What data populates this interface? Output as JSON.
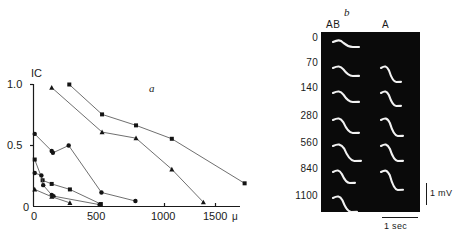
{
  "figure": {
    "panel_a_letter": "a",
    "panel_b_letter": "b"
  },
  "panel_a": {
    "ylabel": "IC",
    "y_ticks": [
      "1.0",
      "0.5",
      "0"
    ],
    "x_ticks": [
      "0",
      "500",
      "1000",
      "1500"
    ],
    "x_unit": "μ"
  },
  "panel_b": {
    "column_labels": [
      "AB",
      "A"
    ],
    "row_labels": [
      "0",
      "70",
      "140",
      "280",
      "560",
      "840",
      "1100"
    ],
    "scale_v": "1 mV",
    "scale_h": "1 sec"
  },
  "chart_data": {
    "type": "line",
    "title": "",
    "xlabel": "μ",
    "ylabel": "IC",
    "xlim": [
      0,
      1750
    ],
    "ylim": [
      0,
      1.0
    ],
    "grid": false,
    "legend": "none",
    "x_ticks": [
      0,
      500,
      1000,
      1500
    ],
    "y_ticks": [
      0,
      0.5,
      1.0
    ],
    "series": [
      {
        "name": "series-1-squares-upper",
        "marker": "square",
        "points": [
          {
            "x": 295,
            "y": 1.0
          },
          {
            "x": 565,
            "y": 0.755
          },
          {
            "x": 845,
            "y": 0.665
          },
          {
            "x": 1140,
            "y": 0.555
          },
          {
            "x": 1740,
            "y": 0.19
          }
        ]
      },
      {
        "name": "series-2-triangles-upper",
        "marker": "triangle",
        "points": [
          {
            "x": 150,
            "y": 0.975
          },
          {
            "x": 565,
            "y": 0.61
          },
          {
            "x": 845,
            "y": 0.56
          },
          {
            "x": 1140,
            "y": 0.305
          },
          {
            "x": 1400,
            "y": 0.035
          }
        ]
      },
      {
        "name": "series-3-circles-mid",
        "marker": "circle",
        "points": [
          {
            "x": 10,
            "y": 0.595
          },
          {
            "x": 150,
            "y": 0.455
          },
          {
            "x": 160,
            "y": 0.44
          },
          {
            "x": 290,
            "y": 0.5
          },
          {
            "x": 560,
            "y": 0.115
          },
          {
            "x": 840,
            "y": 0.045
          }
        ]
      },
      {
        "name": "series-4-squares-lower",
        "marker": "square",
        "points": [
          {
            "x": 10,
            "y": 0.385
          },
          {
            "x": 75,
            "y": 0.215
          },
          {
            "x": 150,
            "y": 0.185
          },
          {
            "x": 300,
            "y": 0.14
          },
          {
            "x": 555,
            "y": 0.02
          }
        ]
      },
      {
        "name": "series-5-circles-lower",
        "marker": "circle",
        "points": [
          {
            "x": 10,
            "y": 0.275
          },
          {
            "x": 65,
            "y": 0.255
          },
          {
            "x": 80,
            "y": 0.175
          },
          {
            "x": 150,
            "y": 0.095
          },
          {
            "x": 165,
            "y": 0.085
          },
          {
            "x": 545,
            "y": 0.015
          }
        ]
      },
      {
        "name": "series-6-triangles-lower",
        "marker": "triangle",
        "points": [
          {
            "x": 10,
            "y": 0.14
          },
          {
            "x": 150,
            "y": 0.08
          },
          {
            "x": 300,
            "y": 0.03
          }
        ]
      }
    ]
  }
}
